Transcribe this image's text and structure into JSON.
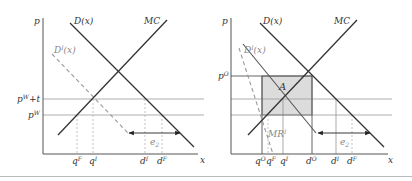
{
  "left_panel": {
    "y_axis_label": "p",
    "x_axis_label": "x",
    "curves": {
      "demand": "D(x)",
      "marginal_cost": "MC",
      "domestic_demand": "D",
      "domestic_demand_sup": "I",
      "domestic_demand_arg": "(x)"
    },
    "price_levels": [
      {
        "base": "p",
        "sup": "W",
        "suffix": "+t"
      },
      {
        "base": "p",
        "sup": "W",
        "suffix": ""
      }
    ],
    "x_ticks": [
      {
        "base": "q",
        "sup": "F"
      },
      {
        "base": "q",
        "sup": "I"
      },
      {
        "base": "d",
        "sup": "I"
      },
      {
        "base": "d",
        "sup": "F"
      }
    ],
    "arrow_label": {
      "base": "e",
      "sub": "2"
    }
  },
  "right_panel": {
    "y_axis_label": "p",
    "x_axis_label": "x",
    "curves": {
      "demand": "D(x)",
      "marginal_cost": "MC",
      "domestic_demand": "D",
      "domestic_demand_sup": "I",
      "domestic_demand_arg": "(x)",
      "marginal_revenue": "MR",
      "marginal_revenue_sup": "I"
    },
    "price_levels": [
      {
        "base": "p",
        "sup": "O",
        "suffix": ""
      }
    ],
    "area_label": "A",
    "x_ticks": [
      {
        "base": "q",
        "sup": "O"
      },
      {
        "base": "q",
        "sup": "F"
      },
      {
        "base": "q",
        "sup": "I"
      },
      {
        "base": "d",
        "sup": "O"
      },
      {
        "base": "d",
        "sup": "I"
      },
      {
        "base": "d",
        "sup": "F"
      }
    ],
    "arrow_label": {
      "base": "e",
      "sub": "2"
    }
  },
  "colors": {
    "curve": "#333333",
    "dashed": "#999999",
    "guide": "#888888",
    "shade": "#dcdcdc"
  }
}
